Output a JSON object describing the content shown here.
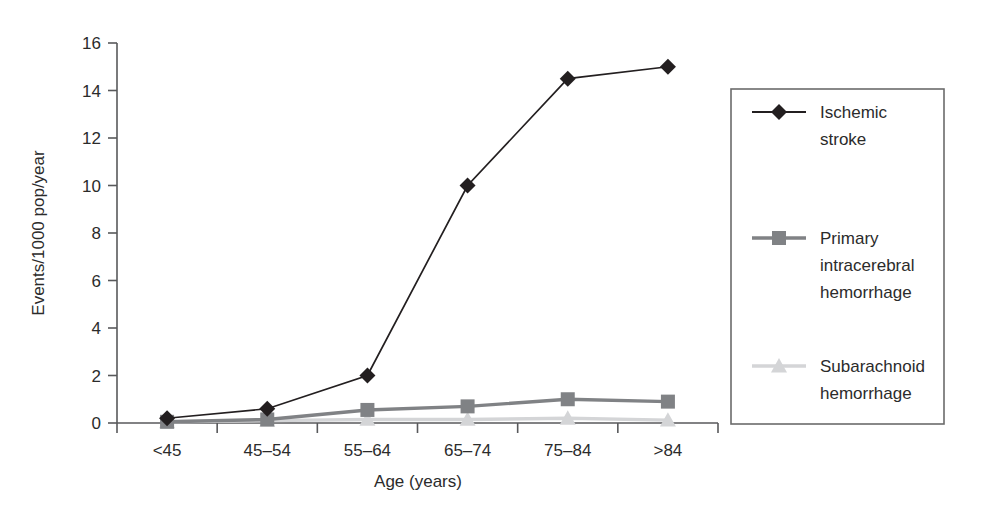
{
  "chart_data": {
    "type": "line",
    "title": "",
    "xlabel": "Age (years)",
    "ylabel": "Events/1000 pop/year",
    "categories": [
      "<45",
      "45–54",
      "55–64",
      "65–74",
      "75–84",
      ">84"
    ],
    "ylim": [
      0,
      16
    ],
    "yticks": [
      0,
      2,
      4,
      6,
      8,
      10,
      12,
      14,
      16
    ],
    "ytick_labels": [
      "0",
      "2",
      "4",
      "6",
      "8",
      "10",
      "12",
      "14",
      "16"
    ],
    "grid": false,
    "legend_position": "right-outside",
    "series": [
      {
        "name": "Ischemic stroke",
        "legend_lines": [
          "Ischemic",
          "stroke"
        ],
        "marker": "diamond",
        "color": "#231f20",
        "values": [
          0.2,
          0.6,
          2.0,
          10.0,
          14.5,
          15.0
        ]
      },
      {
        "name": "Primary intracerebral hemorrhage",
        "legend_lines": [
          "Primary",
          "intracerebral",
          "hemorrhage"
        ],
        "marker": "square",
        "color": "#808285",
        "values": [
          0.05,
          0.15,
          0.55,
          0.7,
          1.0,
          0.9
        ]
      },
      {
        "name": "Subarachnoid hemorrhage",
        "legend_lines": [
          "Subarachnoid",
          "hemorrhage"
        ],
        "marker": "triangle",
        "color": "#d4d5d7",
        "values": [
          0.05,
          0.1,
          0.15,
          0.15,
          0.2,
          0.12
        ]
      }
    ]
  },
  "axes": {
    "y_axis_label": "Events/1000 pop/year",
    "x_axis_label": "Age (years)"
  },
  "colors": {
    "ischemic": "#231f20",
    "intracerebral": "#808285",
    "subarachnoid": "#d4d5d7",
    "axis": "#58595b",
    "legend_border": "#6b6b6b",
    "text": "#2b2b2b"
  }
}
